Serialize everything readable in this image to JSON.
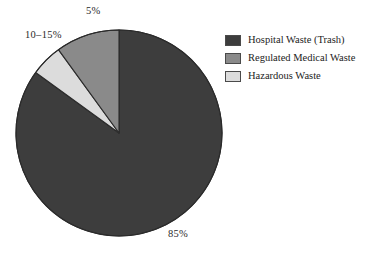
{
  "chart_data": {
    "type": "pie",
    "title": "",
    "subtitle": "",
    "xlabel": "",
    "ylabel": "",
    "grid": false,
    "legend_position": "right",
    "start_angle_deg": 0,
    "direction": "clockwise",
    "categories": [
      "Hospital Waste (Trash)",
      "Regulated Medical Waste",
      "Hazardous Waste"
    ],
    "values": [
      85,
      12.5,
      5
    ],
    "value_labels": [
      "85%",
      "10–15%",
      "5%"
    ],
    "colors": [
      "#3d3d3d",
      "#8a8a8a",
      "#dcdcdc"
    ],
    "slices": [
      {
        "name": "Hospital Waste (Trash)",
        "label": "85%",
        "value": 85,
        "color": "#3d3d3d",
        "start_deg": 0,
        "end_deg": 306
      },
      {
        "name": "Hazardous Waste",
        "label": "5%",
        "value": 5,
        "color": "#dcdcdc",
        "start_deg": 306,
        "end_deg": 324
      },
      {
        "name": "Regulated Medical Waste",
        "label": "10–15%",
        "value": 12.5,
        "color": "#8a8a8a",
        "start_deg": 324,
        "end_deg": 360
      }
    ]
  },
  "labels": {
    "hospital": "85%",
    "regulated": "10–15%",
    "hazardous": "5%"
  },
  "legend": {
    "items": [
      {
        "label": "Hospital Waste (Trash)",
        "color": "#3d3d3d"
      },
      {
        "label": "Regulated Medical Waste",
        "color": "#8a8a8a"
      },
      {
        "label": "Hazardous Waste",
        "color": "#dcdcdc"
      }
    ]
  },
  "style": {
    "background": "#ffffff",
    "outline": "#2b2b2b",
    "text": "#262626"
  },
  "geometry": {
    "center_x": 119,
    "center_y": 133,
    "radius": 103
  }
}
